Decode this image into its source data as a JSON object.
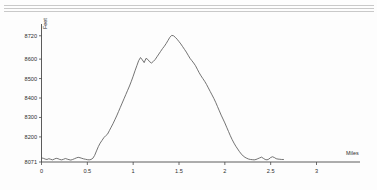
{
  "decor": {
    "top_rules": 3
  },
  "chart_data": {
    "type": "line",
    "title": "",
    "subtitle": "",
    "xlabel": "Miles",
    "ylabel": "Feet",
    "xlim": [
      0,
      3.3
    ],
    "ylim": [
      8071,
      8760
    ],
    "grid": false,
    "legend": null,
    "x_ticks": [
      "0",
      "0.5",
      "1",
      "1.5",
      "2",
      "2.5",
      "3"
    ],
    "x_tick_values": [
      0,
      0.5,
      1,
      1.5,
      2,
      2.5,
      3
    ],
    "y_ticks": [
      "8071",
      "8200",
      "8300",
      "8400",
      "8500",
      "8600",
      "8720"
    ],
    "y_tick_values": [
      8071,
      8200,
      8300,
      8400,
      8500,
      8600,
      8720
    ],
    "series": [
      {
        "name": "Elevation profile",
        "x": [
          0.0,
          0.02,
          0.04,
          0.06,
          0.08,
          0.1,
          0.12,
          0.14,
          0.16,
          0.18,
          0.2,
          0.22,
          0.24,
          0.26,
          0.28,
          0.3,
          0.32,
          0.34,
          0.36,
          0.38,
          0.4,
          0.42,
          0.44,
          0.46,
          0.48,
          0.5,
          0.52,
          0.54,
          0.56,
          0.58,
          0.6,
          0.62,
          0.64,
          0.66,
          0.68,
          0.7,
          0.72,
          0.74,
          0.76,
          0.78,
          0.8,
          0.82,
          0.84,
          0.86,
          0.88,
          0.9,
          0.92,
          0.94,
          0.96,
          0.98,
          1.0,
          1.02,
          1.04,
          1.06,
          1.08,
          1.1,
          1.12,
          1.14,
          1.16,
          1.18,
          1.2,
          1.22,
          1.24,
          1.26,
          1.28,
          1.3,
          1.32,
          1.34,
          1.36,
          1.38,
          1.4,
          1.42,
          1.44,
          1.46,
          1.48,
          1.5,
          1.52,
          1.54,
          1.56,
          1.58,
          1.6,
          1.62,
          1.64,
          1.66,
          1.68,
          1.7,
          1.72,
          1.74,
          1.76,
          1.78,
          1.8,
          1.82,
          1.84,
          1.86,
          1.88,
          1.9,
          1.92,
          1.94,
          1.96,
          1.98,
          2.0,
          2.02,
          2.04,
          2.06,
          2.08,
          2.1,
          2.12,
          2.14,
          2.16,
          2.18,
          2.2,
          2.22,
          2.24,
          2.26,
          2.28,
          2.3,
          2.32,
          2.34,
          2.36,
          2.38,
          2.4,
          2.42,
          2.44,
          2.46,
          2.48,
          2.5,
          2.52,
          2.54,
          2.56,
          2.58,
          2.6,
          2.62,
          2.64
        ],
        "y": [
          8092,
          8090,
          8086,
          8084,
          8088,
          8085,
          8082,
          8086,
          8090,
          8088,
          8084,
          8082,
          8085,
          8089,
          8086,
          8083,
          8081,
          8084,
          8088,
          8092,
          8095,
          8093,
          8090,
          8087,
          8085,
          8083,
          8082,
          8084,
          8090,
          8105,
          8128,
          8150,
          8168,
          8182,
          8196,
          8206,
          8214,
          8232,
          8250,
          8268,
          8288,
          8308,
          8330,
          8352,
          8374,
          8396,
          8418,
          8440,
          8462,
          8486,
          8512,
          8540,
          8566,
          8592,
          8608,
          8596,
          8582,
          8604,
          8598,
          8586,
          8580,
          8588,
          8598,
          8612,
          8626,
          8640,
          8654,
          8666,
          8680,
          8696,
          8712,
          8722,
          8720,
          8712,
          8702,
          8690,
          8678,
          8664,
          8650,
          8636,
          8620,
          8604,
          8592,
          8580,
          8566,
          8548,
          8530,
          8514,
          8500,
          8486,
          8470,
          8452,
          8434,
          8416,
          8398,
          8378,
          8356,
          8334,
          8312,
          8292,
          8272,
          8250,
          8228,
          8206,
          8186,
          8168,
          8152,
          8138,
          8124,
          8112,
          8102,
          8095,
          8090,
          8086,
          8084,
          8083,
          8082,
          8084,
          8088,
          8092,
          8096,
          8090,
          8084,
          8082,
          8086,
          8094,
          8098,
          8094,
          8088,
          8086,
          8085,
          8084,
          8084
        ],
        "color": "#5b5b5b"
      }
    ],
    "annotations": {
      "peak_elevation_ft": 8720,
      "peak_distance_mi": 1.42,
      "min_elevation_ft": 8071,
      "trail_end_mi": 2.64
    }
  }
}
